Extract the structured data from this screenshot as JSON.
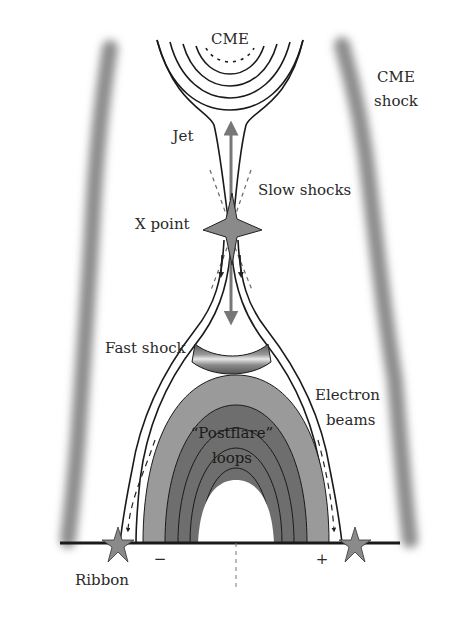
{
  "labels": {
    "cme": "CME",
    "cme_shock_line1": "CME",
    "cme_shock_line2": "shock",
    "jet": "Jet",
    "slow_shocks": "Slow shocks",
    "x_point": "X point",
    "fast_shock": "Fast shock",
    "electron_beams_line1": "Electron",
    "electron_beams_line2": "beams",
    "postflare_line1": "“Postflare”",
    "postflare_line2": "loops",
    "ribbon": "Ribbon",
    "polarity_minus": "−",
    "polarity_plus": "+"
  },
  "colors": {
    "shock_band": "#7a7a7a",
    "outer_loop": "#9a9a9a",
    "inner_loop": "#6e6e6e",
    "star": "#8a8a8a",
    "line": "#1a1a1a",
    "arrow": "#777777"
  }
}
